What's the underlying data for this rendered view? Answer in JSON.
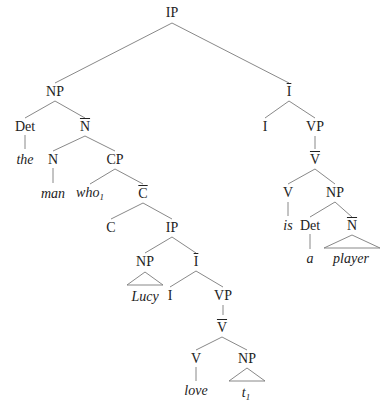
{
  "diagram": {
    "type": "syntax-tree",
    "line_color": "#7a7a7a",
    "nodes": [
      {
        "id": "ip-root",
        "label": "IP",
        "x": 172,
        "y": 13
      },
      {
        "id": "np-subj",
        "label": "NP",
        "x": 55,
        "y": 92
      },
      {
        "id": "ibar-main",
        "label": "I",
        "bar": true,
        "x": 289,
        "y": 92
      },
      {
        "id": "det-1",
        "label": "Det",
        "x": 25,
        "y": 127
      },
      {
        "id": "nbar-1",
        "label": "N",
        "bar": true,
        "x": 85,
        "y": 127
      },
      {
        "id": "word-the",
        "label": "the",
        "italic": true,
        "x": 25,
        "y": 160
      },
      {
        "id": "n-1",
        "label": "N",
        "x": 53,
        "y": 160
      },
      {
        "id": "cp",
        "label": "CP",
        "x": 115,
        "y": 160
      },
      {
        "id": "word-man",
        "label": "man",
        "italic": true,
        "x": 53,
        "y": 194
      },
      {
        "id": "word-who",
        "label": "who",
        "sub": "1",
        "italic": true,
        "x": 90,
        "y": 194
      },
      {
        "id": "cbar",
        "label": "C",
        "bar": true,
        "x": 143,
        "y": 194
      },
      {
        "id": "c",
        "label": "C",
        "x": 111,
        "y": 228
      },
      {
        "id": "ip-emb",
        "label": "IP",
        "x": 172,
        "y": 228
      },
      {
        "id": "np-lucy",
        "label": "NP",
        "x": 145,
        "y": 262
      },
      {
        "id": "ibar-emb",
        "label": "I",
        "bar": true,
        "x": 196,
        "y": 262
      },
      {
        "id": "word-lucy",
        "label": "Lucy",
        "italic": true,
        "x": 145,
        "y": 297
      },
      {
        "id": "i-emb",
        "label": "I",
        "x": 170,
        "y": 296
      },
      {
        "id": "vp-emb",
        "label": "VP",
        "x": 223,
        "y": 296
      },
      {
        "id": "vbar-emb",
        "label": "V",
        "bar": true,
        "x": 222,
        "y": 328
      },
      {
        "id": "v-emb",
        "label": "V",
        "x": 196,
        "y": 359
      },
      {
        "id": "np-trace",
        "label": "NP",
        "x": 247,
        "y": 359
      },
      {
        "id": "word-love",
        "label": "love",
        "italic": true,
        "x": 196,
        "y": 391
      },
      {
        "id": "word-trace",
        "label": "t",
        "sub": "1",
        "italic": true,
        "x": 246,
        "y": 394
      },
      {
        "id": "i-main",
        "label": "I",
        "x": 265,
        "y": 127
      },
      {
        "id": "vp-main",
        "label": "VP",
        "x": 315,
        "y": 127
      },
      {
        "id": "vbar-main",
        "label": "V",
        "bar": true,
        "x": 315,
        "y": 160
      },
      {
        "id": "v-main",
        "label": "V",
        "x": 288,
        "y": 193
      },
      {
        "id": "np-pred",
        "label": "NP",
        "x": 335,
        "y": 193
      },
      {
        "id": "word-is",
        "label": "is",
        "italic": true,
        "x": 288,
        "y": 226
      },
      {
        "id": "det-2",
        "label": "Det",
        "x": 310,
        "y": 226
      },
      {
        "id": "nbar-2",
        "label": "N",
        "bar": true,
        "x": 352,
        "y": 226
      },
      {
        "id": "word-a",
        "label": "a",
        "italic": true,
        "x": 310,
        "y": 259
      },
      {
        "id": "word-player",
        "label": "player",
        "italic": true,
        "x": 351,
        "y": 259
      }
    ],
    "edges": [
      [
        172,
        23,
        55,
        83
      ],
      [
        172,
        23,
        289,
        83
      ],
      [
        55,
        101,
        25,
        118
      ],
      [
        55,
        101,
        85,
        118
      ],
      [
        25,
        135,
        25,
        149
      ],
      [
        85,
        136,
        53,
        151
      ],
      [
        85,
        136,
        115,
        151
      ],
      [
        53,
        168,
        53,
        183
      ],
      [
        115,
        169,
        90,
        184
      ],
      [
        115,
        169,
        143,
        184
      ],
      [
        143,
        203,
        111,
        219
      ],
      [
        143,
        203,
        172,
        219
      ],
      [
        172,
        237,
        145,
        253
      ],
      [
        172,
        237,
        196,
        253
      ],
      [
        196,
        271,
        170,
        287
      ],
      [
        196,
        271,
        223,
        287
      ],
      [
        223,
        305,
        223,
        315
      ],
      [
        222,
        337,
        196,
        350
      ],
      [
        222,
        337,
        247,
        350
      ],
      [
        196,
        367,
        196,
        381
      ],
      [
        289,
        101,
        265,
        118
      ],
      [
        289,
        101,
        315,
        118
      ],
      [
        315,
        136,
        315,
        149
      ],
      [
        315,
        169,
        288,
        184
      ],
      [
        315,
        169,
        335,
        184
      ],
      [
        288,
        202,
        288,
        216
      ],
      [
        335,
        202,
        310,
        217
      ],
      [
        335,
        202,
        352,
        217
      ],
      [
        310,
        234,
        310,
        249
      ]
    ],
    "triangles": [
      {
        "apex": [
          145,
          272
        ],
        "left": [
          127,
          285
        ],
        "right": [
          163,
          285
        ]
      },
      {
        "apex": [
          247,
          368
        ],
        "left": [
          229,
          381
        ],
        "right": [
          265,
          381
        ]
      },
      {
        "apex": [
          352,
          235
        ],
        "left": [
          324,
          248
        ],
        "right": [
          380,
          248
        ]
      }
    ]
  }
}
